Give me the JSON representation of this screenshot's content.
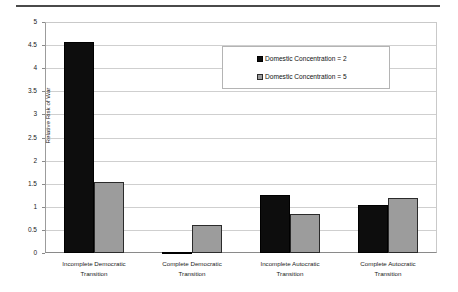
{
  "chart_data": {
    "type": "bar",
    "title": "",
    "subtitle": "",
    "xlabel": "",
    "ylabel": "Relative Risk of War",
    "ylim": [
      0,
      5
    ],
    "ytick_values": [
      0,
      0.5,
      1,
      1.5,
      2,
      2.5,
      3,
      3.5,
      4,
      4.5,
      5
    ],
    "ytick_labels": [
      "0",
      "0.5",
      "1",
      "1.5",
      "2",
      "2.5",
      "3",
      "3.5",
      "4",
      "4.5",
      "5"
    ],
    "grid": true,
    "legend_position": "upper-center-right",
    "categories": [
      "Incomplete Democratic Transition",
      "Complete Democratic Transition",
      "Incomplete Autocratic Transition",
      "Complete Autocratic Transition"
    ],
    "category_lines": [
      [
        "Incomplete Democratic",
        "Transition"
      ],
      [
        "Complete Democratic",
        "Transition"
      ],
      [
        "Incomplete Autocratic",
        "Transition"
      ],
      [
        "Complete Autocratic",
        "Transition"
      ]
    ],
    "series": [
      {
        "name": "Domestic Concentration = 2",
        "color": "#0d0d0d",
        "values": [
          4.57,
          0.03,
          1.26,
          1.04
        ]
      },
      {
        "name": "Domestic Concentration = 5",
        "color": "#9c9c9c",
        "values": [
          1.54,
          0.6,
          0.85,
          1.19
        ]
      }
    ]
  },
  "legend": {
    "items": [
      {
        "label": "Domestic Concentration = 2",
        "swatch": "black-square-swatch"
      },
      {
        "label": "Domestic Concentration = 5",
        "swatch": "gray-square-swatch"
      }
    ]
  }
}
